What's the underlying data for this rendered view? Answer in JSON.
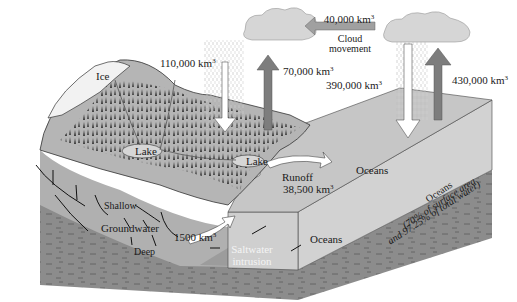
{
  "diagram": {
    "type": "water-cycle-illustration",
    "colors": {
      "background": "#ffffff",
      "ocean_surface": "#c9c9c9",
      "ocean_deep": "#9a9a9a",
      "bedrock": "#8a8a8a",
      "land": "#b5b5b5",
      "ice": "#f2f2f2",
      "cloud": "#d6d6d6",
      "evap_arrow": "#7d7d7d",
      "precip_arrow": "#ffffff",
      "text": "#1a1a1a"
    },
    "labels": {
      "ice": "Ice",
      "lake_1": "Lake",
      "lake_2": "Lake",
      "precip_land": "110,000 km",
      "precip_land_unit_sup": "3",
      "evap_land": "70,000 km",
      "evap_land_unit_sup": "3",
      "cloud_movement_value": "40,000 km",
      "cloud_movement_unit_sup": "3",
      "cloud_movement_line1": "Cloud",
      "cloud_movement_line2": "movement",
      "precip_ocean": "390,000 km",
      "precip_ocean_unit_sup": "3",
      "evap_ocean": "430,000 km",
      "evap_ocean_unit_sup": "3",
      "runoff_label": "Runoff",
      "runoff_value": "38,500 km",
      "runoff_unit_sup": "3",
      "oceans_surface": "Oceans",
      "oceans_side_line1": "Oceans",
      "oceans_side_line2": "(70% of surface area",
      "oceans_side_line3": "and 97.25% of total water)",
      "oceans_subsurface": "Oceans",
      "shallow": "Shallow",
      "groundwater": "Groundwater",
      "deep": "Deep",
      "groundwater_flow": "1500 km",
      "groundwater_flow_unit_sup": "3",
      "saltwater_line1": "Saltwater",
      "saltwater_line2": "intrusion"
    }
  }
}
